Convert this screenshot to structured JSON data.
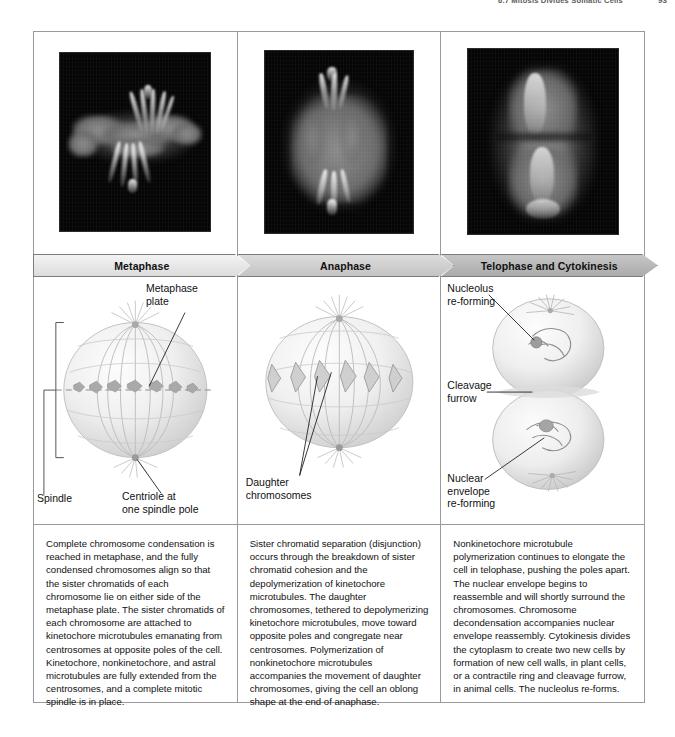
{
  "running_head": {
    "text": "6.7  Mitosis Divides Somatic Cells",
    "page_number": "93"
  },
  "figure": {
    "columns": [
      {
        "id": "metaphase",
        "banner_label": "Metaphase",
        "banner_color": "#e9e9e9",
        "micrograph_name": "metaphase-spindle-micrograph",
        "diagram_name": "metaphase-cell-diagram",
        "labels": [
          {
            "name": "metaphase-plate-label",
            "text": "Metaphase\nplate"
          },
          {
            "name": "centriole-label",
            "text": "Centriole at\none spindle pole"
          },
          {
            "name": "spindle-label",
            "text": "Spindle"
          }
        ],
        "caption": "Complete chromosome condensation is reached in metaphase, and the fully condensed chromosomes align so that the sister chromatids of each chromosome lie on either side of the metaphase plate. The sister chromatids of each chromosome are attached to kinetochore microtubules emanating from centrosomes at opposite poles of the cell. Kinetochore, nonkinetochore, and astral microtubules are fully extended from the centrosomes, and a complete mitotic spindle is in place."
      },
      {
        "id": "anaphase",
        "banner_label": "Anaphase",
        "banner_color": "#cfcfcf",
        "micrograph_name": "anaphase-spindle-micrograph",
        "diagram_name": "anaphase-cell-diagram",
        "labels": [
          {
            "name": "daughter-chromosomes-label",
            "text": "Daughter\nchromosomes"
          }
        ],
        "caption": "Sister chromatid separation (disjunction) occurs through the breakdown of sister chromatid cohesion and the depolymerization of kinetochore microtubules. The daughter chromosomes, tethered to depolymerizing kinetochore microtubules, move toward opposite poles and congregate near centrosomes. Polymerization of nonkinetochore microtubules accompanies the movement of daughter chromosomes, giving the cell an oblong shape at the end of anaphase."
      },
      {
        "id": "telophase",
        "banner_label": "Telophase and Cytokinesis",
        "banner_color": "#b4b4b4",
        "micrograph_name": "telophase-cytokinesis-micrograph",
        "diagram_name": "telophase-cell-diagram",
        "labels": [
          {
            "name": "nucleolus-label",
            "text": "Nucleolus\nre-forming"
          },
          {
            "name": "cleavage-furrow-label",
            "text": "Cleavage\nfurrow"
          },
          {
            "name": "nuclear-envelope-label",
            "text": "Nuclear\nenvelope\nre-forming"
          }
        ],
        "caption": "Nonkinetochore microtubule polymerization continues to elongate the cell in telophase, pushing the poles apart. The nuclear envelope begins to reassemble and will shortly surround the chromosomes. Chromosome decondensation accompanies nuclear envelope reassembly. Cytokinesis divides the cytoplasm to create two new cells by formation of new cell walls, in plant cells, or a contractile ring and cleavage furrow, in animal cells. The nucleolus re-forms."
      }
    ]
  }
}
